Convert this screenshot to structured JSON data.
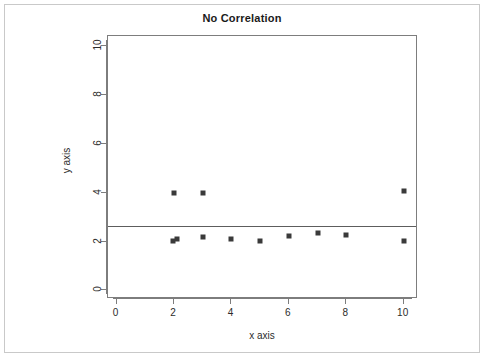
{
  "chart_data": {
    "type": "scatter",
    "title": "No Correlation",
    "xlabel": "x axis",
    "ylabel": "y axis",
    "xlim": [
      -0.3,
      10.5
    ],
    "ylim": [
      -0.35,
      10.4
    ],
    "xticks": [
      0,
      2,
      4,
      6,
      8,
      10
    ],
    "yticks": [
      0,
      2,
      4,
      6,
      8,
      10
    ],
    "xticklabels": [
      "0",
      "2",
      "4",
      "6",
      "8",
      "10"
    ],
    "yticklabels": [
      "0",
      "2",
      "4",
      "6",
      "8",
      "10"
    ],
    "grid": false,
    "legend": false,
    "marker": "filled-square",
    "marker_color": "#3a3a3a",
    "points": [
      {
        "x": 2.0,
        "y": 4.0
      },
      {
        "x": 3.0,
        "y": 4.0
      },
      {
        "x": 10.0,
        "y": 4.05
      },
      {
        "x": 1.95,
        "y": 2.02
      },
      {
        "x": 2.1,
        "y": 2.12
      },
      {
        "x": 3.0,
        "y": 2.2
      },
      {
        "x": 4.0,
        "y": 2.12
      },
      {
        "x": 5.0,
        "y": 2.03
      },
      {
        "x": 6.0,
        "y": 2.22
      },
      {
        "x": 7.0,
        "y": 2.35
      },
      {
        "x": 8.0,
        "y": 2.25
      },
      {
        "x": 10.0,
        "y": 2.03
      }
    ],
    "trendline": {
      "type": "horizontal",
      "y": 2.65,
      "color": "#5d5d5d",
      "label": "regression line"
    },
    "annotations": []
  }
}
